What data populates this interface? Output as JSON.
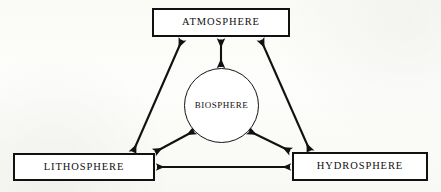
{
  "diagram": {
    "background_color": "#fbfbf8",
    "stroke_color": "#111111",
    "fill_color": "#ffffff",
    "nodes": [
      {
        "id": "atmosphere",
        "label": "ATMOSPHERE",
        "shape": "rectangle",
        "x": 152,
        "y": 8,
        "width": 138,
        "height": 29
      },
      {
        "id": "biosphere",
        "label": "BIOSPHERE",
        "shape": "circle",
        "x": 184,
        "y": 68,
        "width": 75,
        "height": 75
      },
      {
        "id": "lithosphere",
        "label": "LITHOSPHERE",
        "shape": "rectangle",
        "x": 13,
        "y": 153,
        "width": 142,
        "height": 28
      },
      {
        "id": "hydrosphere",
        "label": "HYDROSPHERE",
        "shape": "rectangle",
        "x": 292,
        "y": 152,
        "width": 136,
        "height": 29
      }
    ],
    "connections": [
      {
        "id": "atmosphere-biosphere",
        "from": "atmosphere",
        "to": "biosphere",
        "style": "double-headed-arrow",
        "orientation": "vertical"
      },
      {
        "id": "atmosphere-lithosphere",
        "from": "atmosphere",
        "to": "lithosphere",
        "style": "double-headed-arrow",
        "orientation": "diagonal-left"
      },
      {
        "id": "atmosphere-hydrosphere",
        "from": "atmosphere",
        "to": "hydrosphere",
        "style": "double-headed-arrow",
        "orientation": "diagonal-right"
      },
      {
        "id": "biosphere-lithosphere",
        "from": "biosphere",
        "to": "lithosphere",
        "style": "double-headed-arrow",
        "orientation": "diagonal-left-short"
      },
      {
        "id": "biosphere-hydrosphere",
        "from": "biosphere",
        "to": "hydrosphere",
        "style": "double-headed-arrow",
        "orientation": "diagonal-right-short"
      },
      {
        "id": "lithosphere-hydrosphere",
        "from": "lithosphere",
        "to": "hydrosphere",
        "style": "double-headed-arrow",
        "orientation": "horizontal"
      }
    ]
  }
}
